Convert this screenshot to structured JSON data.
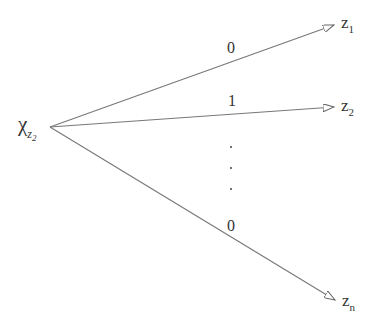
{
  "diagram": {
    "type": "tree-fanout",
    "source_node": {
      "symbol": "χ",
      "subscript": "z",
      "subsubscript": "2"
    },
    "targets": [
      {
        "symbol": "z",
        "subscript": "1",
        "edge_label": "0"
      },
      {
        "symbol": "z",
        "subscript": "2",
        "edge_label": "1"
      },
      {
        "symbol": "z",
        "subscript": "n",
        "edge_label": "0"
      }
    ],
    "ellipsis": "⋮",
    "colors": {
      "line": "#666666",
      "text": "#333333",
      "background": "#ffffff"
    }
  }
}
